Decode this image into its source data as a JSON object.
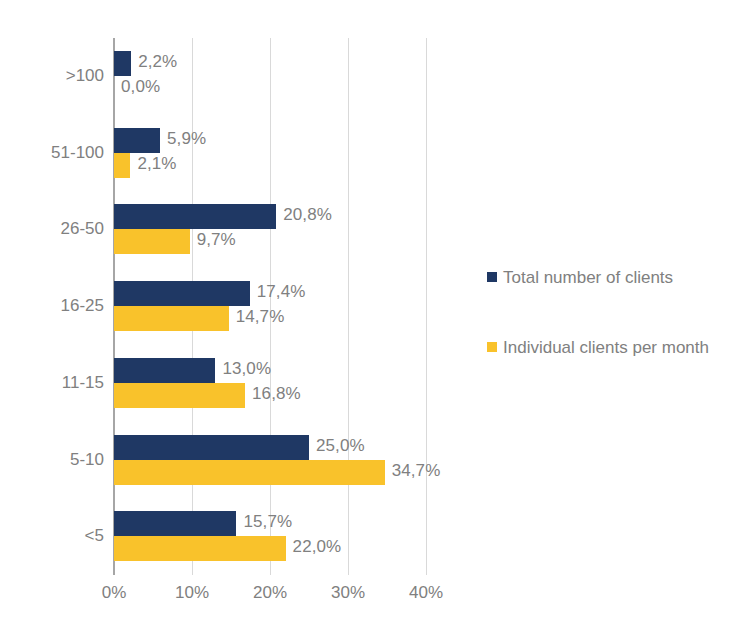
{
  "chart_data": {
    "type": "bar",
    "orientation": "horizontal",
    "title": "",
    "subtitle": "",
    "xlabel": "",
    "ylabel": "",
    "categories": [
      ">100",
      "51-100",
      "26-50",
      "16-25",
      "11-15",
      "5-10",
      "<5"
    ],
    "series": [
      {
        "name": "Total number of clients",
        "color": "#1F3864",
        "values": [
          2.2,
          5.9,
          20.8,
          17.4,
          13.0,
          25.0,
          15.7
        ],
        "labels": [
          "2,2%",
          "5,9%",
          "20,8%",
          "17,4%",
          "13,0%",
          "25,0%",
          "15,7%"
        ]
      },
      {
        "name": "Individual clients per month",
        "color": "#F9C22B",
        "values": [
          0.0,
          2.1,
          9.7,
          14.7,
          16.8,
          34.7,
          22.0
        ],
        "labels": [
          "0,0%",
          "2,1%",
          "9,7%",
          "14,7%",
          "16,8%",
          "34,7%",
          "22,0%"
        ]
      }
    ],
    "xlim": [
      0,
      40
    ],
    "xticks": [
      0,
      10,
      20,
      30,
      40
    ],
    "xtick_labels": [
      "0%",
      "10%",
      "20%",
      "30%",
      "40%"
    ],
    "grid": true,
    "grid_axis": "x",
    "legend_position": "right",
    "value_labels": true,
    "label_format": "comma-decimal-percent",
    "colors": {
      "series_0": "#1F3864",
      "series_1": "#F9C22B",
      "text": "#808080",
      "gridline": "#d9d9d9",
      "axis": "#a6a6a6",
      "background": "#ffffff"
    }
  },
  "legend": {
    "entries": [
      {
        "label": "Total number of clients",
        "color": "#1F3864"
      },
      {
        "label": "Individual clients per month",
        "color": "#F9C22B"
      }
    ]
  }
}
